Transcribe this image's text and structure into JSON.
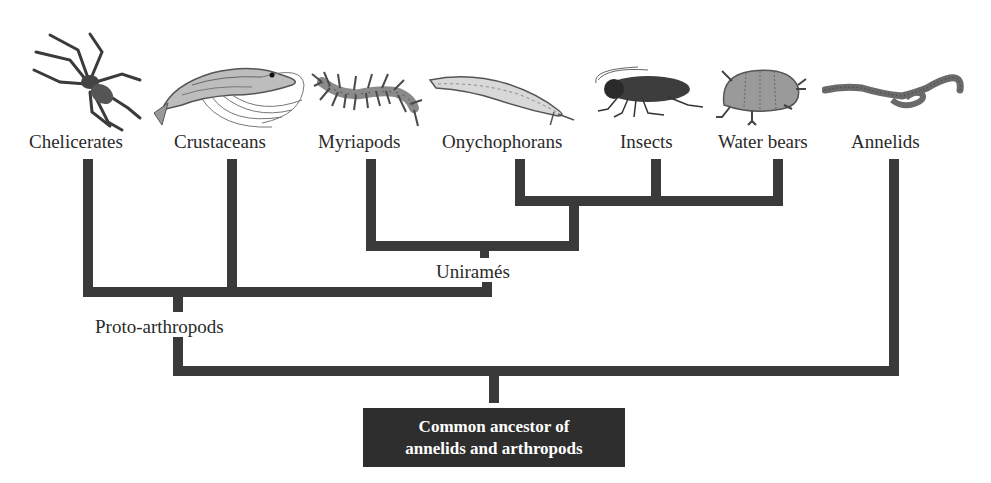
{
  "diagram": {
    "type": "phylogenetic-tree",
    "taxa": [
      {
        "label": "Chelicerates",
        "icon": "spider-icon"
      },
      {
        "label": "Crustaceans",
        "icon": "shrimp-icon"
      },
      {
        "label": "Myriapods",
        "icon": "centipede-icon"
      },
      {
        "label": "Onychophorans",
        "icon": "velvet-worm-icon"
      },
      {
        "label": "Insects",
        "icon": "cockroach-icon"
      },
      {
        "label": "Water bears",
        "icon": "tardigrade-icon"
      },
      {
        "label": "Annelids",
        "icon": "earthworm-icon"
      }
    ],
    "nodes": {
      "uniramia": "Uniramés",
      "proto_arthropods": "Proto-arthropods",
      "root_line1": "Common ancestor of",
      "root_line2": "annelids and arthropods"
    },
    "colors": {
      "branch": "#3a3a3a",
      "root_box": "#2e2e2e",
      "root_text": "#ffffff",
      "label_text": "#2a2a2a"
    }
  }
}
